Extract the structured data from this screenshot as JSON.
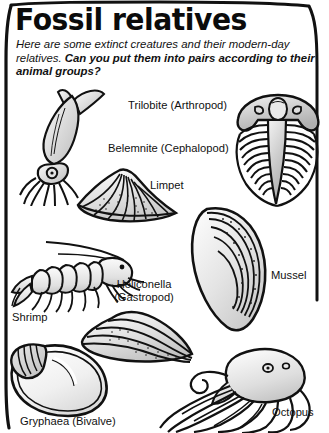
{
  "page": {
    "title": "Fossil relatives",
    "intro_plain": "Here are some extinct creatures and their modern-day relatives. ",
    "intro_bold": "Can you put them into pairs according to their animal groups?",
    "border_color": "#111111",
    "background_color": "#ffffff",
    "text_color": "#111111"
  },
  "captions": {
    "trilobite": "Trilobite (Arthropod)",
    "belemnite": "Belemnite (Cephalopod)",
    "limpet": "Limpet",
    "mussel": "Mussel",
    "heliconella": "Heliconella (Gastropod)",
    "shrimp": "Shrimp",
    "gryphaea": "Gryphaea (Bivalve)",
    "octopus": "Octopus"
  },
  "figures": [
    {
      "id": "belemnite",
      "name": "belemnite-illustration"
    },
    {
      "id": "trilobite",
      "name": "trilobite-illustration"
    },
    {
      "id": "limpet",
      "name": "limpet-illustration"
    },
    {
      "id": "mussel",
      "name": "mussel-illustration"
    },
    {
      "id": "shrimp",
      "name": "shrimp-illustration"
    },
    {
      "id": "heliconella",
      "name": "heliconella-illustration"
    },
    {
      "id": "gryphaea",
      "name": "gryphaea-illustration"
    },
    {
      "id": "octopus",
      "name": "octopus-illustration"
    }
  ]
}
